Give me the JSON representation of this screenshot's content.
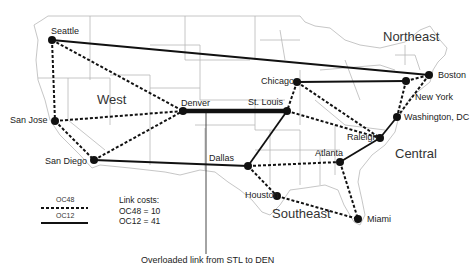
{
  "regions": [
    {
      "id": "west",
      "label": "West",
      "x": 97,
      "y": 93
    },
    {
      "id": "northeast",
      "label": "Northeast",
      "x": 383,
      "y": 30
    },
    {
      "id": "central",
      "label": "Central",
      "x": 395,
      "y": 147
    },
    {
      "id": "southeast",
      "label": "Southeast",
      "x": 272,
      "y": 207
    }
  ],
  "nodes": [
    {
      "id": "seattle",
      "label": "Seattle",
      "x": 52,
      "y": 40,
      "lx": 51,
      "ly": 27
    },
    {
      "id": "san_jose",
      "label": "San Jose",
      "x": 55,
      "y": 121,
      "lx": 10,
      "ly": 116
    },
    {
      "id": "san_diego",
      "label": "San Diego",
      "x": 94,
      "y": 160,
      "lx": 45,
      "ly": 157
    },
    {
      "id": "denver",
      "label": "Denver",
      "x": 183,
      "y": 111,
      "lx": 181,
      "ly": 99
    },
    {
      "id": "st_louis",
      "label": "St. Louis",
      "x": 287,
      "y": 111,
      "lx": 248,
      "ly": 98
    },
    {
      "id": "chicago",
      "label": "Chicago",
      "x": 297,
      "y": 82,
      "lx": 261,
      "ly": 77
    },
    {
      "id": "dallas",
      "label": "Dallas",
      "x": 248,
      "y": 166,
      "lx": 209,
      "ly": 154
    },
    {
      "id": "houston",
      "label": "Houston",
      "x": 277,
      "y": 196,
      "lx": 245,
      "ly": 191
    },
    {
      "id": "atlanta",
      "label": "Atlanta",
      "x": 340,
      "y": 162,
      "lx": 315,
      "ly": 149
    },
    {
      "id": "raleigh",
      "label": "Raleigh",
      "x": 380,
      "y": 138,
      "lx": 347,
      "ly": 133
    },
    {
      "id": "washington_dc",
      "label": "Washington, DC",
      "x": 397,
      "y": 117,
      "lx": 404,
      "ly": 113
    },
    {
      "id": "new_york",
      "label": "New York",
      "x": 406,
      "y": 81,
      "lx": 415,
      "ly": 93
    },
    {
      "id": "boston",
      "label": "Boston",
      "x": 429,
      "y": 75,
      "lx": 438,
      "ly": 71
    },
    {
      "id": "miami",
      "label": "Miami",
      "x": 358,
      "y": 219,
      "lx": 367,
      "ly": 215
    }
  ],
  "links": [
    {
      "from": "seattle",
      "to": "boston",
      "type": "OC12"
    },
    {
      "from": "chicago",
      "to": "new_york",
      "type": "OC12"
    },
    {
      "from": "denver",
      "to": "st_louis",
      "type": "OC12",
      "overloaded": true
    },
    {
      "from": "st_louis",
      "to": "dallas",
      "type": "OC12"
    },
    {
      "from": "san_diego",
      "to": "dallas",
      "type": "OC12"
    },
    {
      "from": "atlanta",
      "to": "raleigh",
      "type": "OC12"
    },
    {
      "from": "raleigh",
      "to": "washington_dc",
      "type": "OC12"
    },
    {
      "from": "seattle",
      "to": "san_jose",
      "type": "OC48"
    },
    {
      "from": "seattle",
      "to": "denver",
      "type": "OC48"
    },
    {
      "from": "san_jose",
      "to": "denver",
      "type": "OC48"
    },
    {
      "from": "san_jose",
      "to": "san_diego",
      "type": "OC48"
    },
    {
      "from": "san_diego",
      "to": "denver",
      "type": "OC48"
    },
    {
      "from": "chicago",
      "to": "st_louis",
      "type": "OC48"
    },
    {
      "from": "chicago",
      "to": "raleigh",
      "type": "OC48"
    },
    {
      "from": "st_louis",
      "to": "raleigh",
      "type": "OC48"
    },
    {
      "from": "new_york",
      "to": "boston",
      "type": "OC48"
    },
    {
      "from": "new_york",
      "to": "washington_dc",
      "type": "OC48"
    },
    {
      "from": "boston",
      "to": "washington_dc",
      "type": "OC48"
    },
    {
      "from": "dallas",
      "to": "houston",
      "type": "OC48"
    },
    {
      "from": "dallas",
      "to": "atlanta",
      "type": "OC48"
    },
    {
      "from": "houston",
      "to": "miami",
      "type": "OC48"
    },
    {
      "from": "atlanta",
      "to": "miami",
      "type": "OC48"
    }
  ],
  "legend": {
    "oc48_label": "OC48",
    "oc12_label": "OC12",
    "costs_title": "Link costs:",
    "oc48_cost": "OC48 = 10",
    "oc12_cost": "OC12 = 41"
  },
  "annotation": {
    "caption": "Overloaded link from STL to DEN",
    "pointer_x": 206,
    "pointer_y_top": 111,
    "pointer_y_bottom": 254
  },
  "colors": {
    "link": "#111111",
    "map_border": "#b8b8b8",
    "node": "#111111",
    "text": "#222222"
  }
}
